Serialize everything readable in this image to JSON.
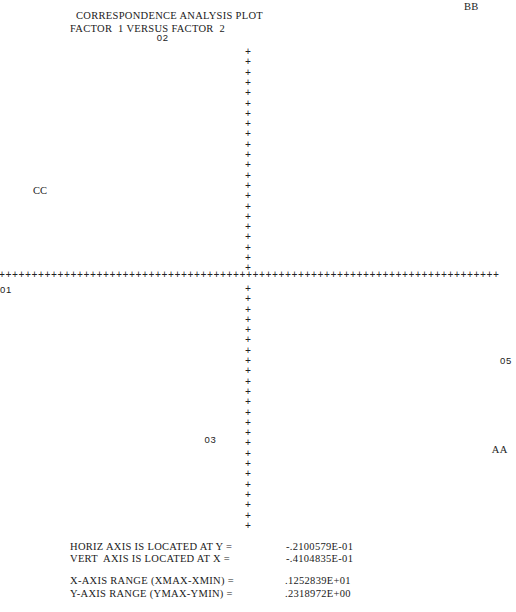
{
  "chart_data": {
    "type": "scatter",
    "title": "CORRESPONDENCE ANALYSIS PLOT",
    "subtitle": "FACTOR  1 VERSUS FACTOR  2",
    "xlabel": "Factor 1",
    "ylabel": "Factor 2",
    "axis_marker": "+",
    "grid": false,
    "points": [
      {
        "label": "04",
        "x": 0.42,
        "y": 0.126,
        "group": "column"
      },
      {
        "label": "BB",
        "x": 0.5,
        "y": 0.109,
        "group": "row"
      },
      {
        "label": "02",
        "x": -0.27,
        "y": 0.094,
        "group": "column"
      },
      {
        "label": "CC",
        "x": -0.58,
        "y": 0.02,
        "group": "row"
      },
      {
        "label": "01",
        "x": -0.75,
        "y": -0.028,
        "group": "column"
      },
      {
        "label": "05",
        "x": 0.85,
        "y": -0.062,
        "group": "column"
      },
      {
        "label": "03",
        "x": -0.15,
        "y": -0.1,
        "group": "column"
      },
      {
        "label": "AA",
        "x": 0.57,
        "y": -0.105,
        "group": "row"
      }
    ],
    "horiz_axis_y": -0.02100579,
    "vert_axis_x": -0.04104835,
    "x_range": 1.252839,
    "y_range": 0.2318972
  },
  "footer": {
    "horiz_axis_label": "HORIZ AXIS IS LOCATED AT Y =",
    "horiz_axis_value": "-.2100579E-01",
    "vert_axis_label": "VERT  AXIS IS LOCATED AT X =",
    "vert_axis_value": "-.4104835E-01",
    "x_range_label": "X-AXIS RANGE (XMAX-XMIN) =",
    "x_range_value": ".1252839E+01",
    "y_range_label": "Y-AXIS RANGE (YMAX-YMIN) =",
    "y_range_value": ".2318972E+00"
  }
}
